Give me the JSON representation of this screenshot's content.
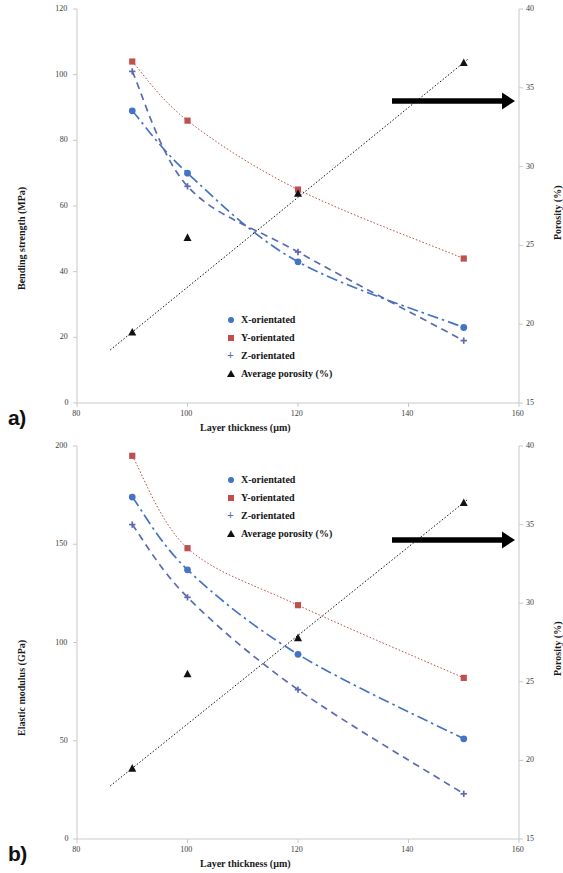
{
  "figure": {
    "panel_a_tag": "a)",
    "panel_b_tag": "b)"
  },
  "legend": {
    "items": [
      {
        "label": "X-orientated",
        "marker": "circle-marker-icon",
        "color": "#4573c4"
      },
      {
        "label": "Y-orientated",
        "marker": "square-marker-icon",
        "color": "#c0504d"
      },
      {
        "label": "Z-orientated",
        "marker": "plus-marker-icon",
        "color": "#5b6bb0"
      },
      {
        "label": "Average porosity (%)",
        "marker": "triangle-marker-icon",
        "color": "#111111"
      }
    ]
  },
  "chart_data": [
    {
      "panel": "a)",
      "type": "line",
      "title": "",
      "xlabel": "Layer thickness (µm)",
      "ylabel": "Bending strength (MPa)",
      "y2label": "Porosity (%)",
      "x": [
        90,
        100,
        120,
        150
      ],
      "xlim": [
        80,
        160
      ],
      "xticks": [
        "80",
        "100",
        "120",
        "140",
        "160"
      ],
      "xtick_values": [
        80,
        100,
        120,
        140,
        160
      ],
      "ylim": [
        0,
        120
      ],
      "yticks": [
        "0",
        "20",
        "40",
        "60",
        "80",
        "100",
        "120"
      ],
      "ytick_values": [
        0,
        20,
        40,
        60,
        80,
        100,
        120
      ],
      "y2lim": [
        15,
        40
      ],
      "y2ticks": [
        "15",
        "20",
        "25",
        "30",
        "35",
        "40"
      ],
      "y2tick_values": [
        15,
        20,
        25,
        30,
        35,
        40
      ],
      "grid": false,
      "legend_position": "center",
      "annotation": "arrow pointing to right axis",
      "series": [
        {
          "name": "X-orientated",
          "axis": "left",
          "color": "#4573c4",
          "linestyle": "dash-dot",
          "marker": "circle",
          "values": [
            89,
            70,
            43,
            23
          ]
        },
        {
          "name": "Y-orientated",
          "axis": "left",
          "color": "#c0504d",
          "linestyle": "dotted",
          "marker": "square",
          "values": [
            104,
            86,
            65,
            44
          ]
        },
        {
          "name": "Z-orientated",
          "axis": "left",
          "color": "#5b6bb0",
          "linestyle": "dashed",
          "marker": "plus",
          "values": [
            101,
            66,
            46,
            19
          ]
        },
        {
          "name": "Average porosity (%)",
          "axis": "right",
          "color": "#111111",
          "linestyle": "dotted",
          "marker": "triangle",
          "values": [
            19.5,
            25.5,
            28.3,
            36.6
          ]
        }
      ]
    },
    {
      "panel": "b)",
      "type": "line",
      "title": "",
      "xlabel": "Layer thickness (µm)",
      "ylabel": "Elastic modulus (GPa)",
      "y2label": "Porosity (%)",
      "x": [
        90,
        100,
        120,
        150
      ],
      "xlim": [
        80,
        160
      ],
      "xticks": [
        "80",
        "100",
        "120",
        "140",
        "160"
      ],
      "xtick_values": [
        80,
        100,
        120,
        140,
        160
      ],
      "ylim": [
        0,
        200
      ],
      "yticks": [
        "0",
        "50",
        "100",
        "150",
        "200"
      ],
      "ytick_values": [
        0,
        50,
        100,
        150,
        200
      ],
      "y2lim": [
        15,
        40
      ],
      "y2ticks": [
        "15",
        "20",
        "25",
        "30",
        "35",
        "40"
      ],
      "y2tick_values": [
        15,
        20,
        25,
        30,
        35,
        40
      ],
      "grid": false,
      "legend_position": "upper center",
      "annotation": "arrow pointing to right axis",
      "series": [
        {
          "name": "X-orientated",
          "axis": "left",
          "color": "#4573c4",
          "linestyle": "dash-dot",
          "marker": "circle",
          "values": [
            174,
            137,
            94,
            51
          ]
        },
        {
          "name": "Y-orientated",
          "axis": "left",
          "color": "#c0504d",
          "linestyle": "dotted",
          "marker": "square",
          "values": [
            195,
            148,
            119,
            82
          ]
        },
        {
          "name": "Z-orientated",
          "axis": "left",
          "color": "#5b6bb0",
          "linestyle": "dashed",
          "marker": "plus",
          "values": [
            160,
            123,
            76,
            23
          ]
        },
        {
          "name": "Average porosity (%)",
          "axis": "right",
          "color": "#111111",
          "linestyle": "dotted",
          "marker": "triangle",
          "values": [
            19.5,
            25.5,
            27.8,
            36.4
          ]
        }
      ]
    }
  ]
}
